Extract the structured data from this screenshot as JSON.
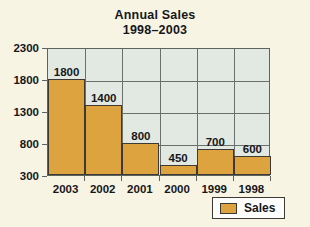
{
  "chart_data": {
    "type": "bar",
    "title": "Annual Sales",
    "subtitle": "1998–2003",
    "xlabel": "",
    "ylabel": "",
    "categories": [
      "2003",
      "2002",
      "2001",
      "2000",
      "1999",
      "1998"
    ],
    "values": [
      1800,
      1400,
      800,
      450,
      700,
      600
    ],
    "data_labels": [
      "1800",
      "1400",
      "800",
      "450",
      "700",
      "600"
    ],
    "series": [
      {
        "name": "Sales",
        "values": [
          1800,
          1400,
          800,
          450,
          700,
          600
        ],
        "color": "#dda33e"
      }
    ],
    "ylim": [
      300,
      2300
    ],
    "ytick_labels": [
      "2300",
      "1800",
      "1300",
      "800",
      "300"
    ],
    "ytick_values": [
      2300,
      1800,
      1300,
      800,
      300
    ],
    "grid": true,
    "legend_position": "bottom-right",
    "legend_entries": [
      "Sales"
    ],
    "plot_background": "#e2e9e2",
    "figure_background": "#f7f4e4",
    "axis_color": "#5f6360"
  },
  "legend": {
    "label": "Sales",
    "swatch_name": "sales-color-swatch"
  }
}
